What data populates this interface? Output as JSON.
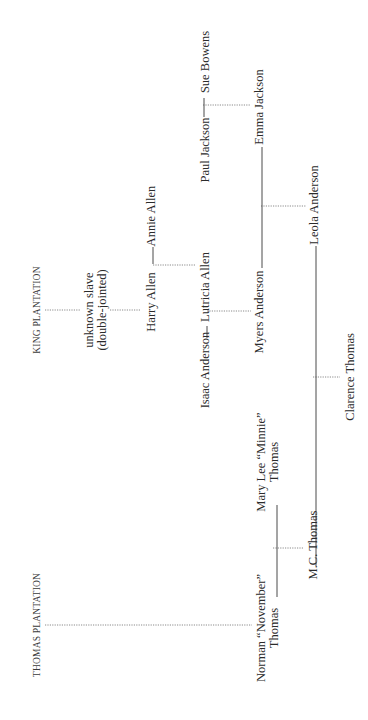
{
  "diagram": {
    "orientation": "rotated-90-ccw",
    "plantations": [
      {
        "id": "king",
        "label": "KING PLANTATION"
      },
      {
        "id": "thomas",
        "label": "THOMAS PLANTATION"
      }
    ],
    "people": {
      "unknown_slave": {
        "line1": "unknown slave",
        "line2": "(double-jointed)"
      },
      "harry_allen": {
        "name": "Harry Allen"
      },
      "annie_allen": {
        "name": "Annie Allen"
      },
      "lutricia_allen": {
        "name": "Lutricia Allen"
      },
      "isaac_anderson": {
        "name": "Isaac Anderson"
      },
      "myers_anderson": {
        "name": "Myers Anderson"
      },
      "paul_jackson": {
        "name": "Paul Jackson"
      },
      "sue_bowens": {
        "name": "Sue Bowens"
      },
      "emma_jackson": {
        "name": "Emma Jackson"
      },
      "leola_anderson": {
        "name": "Leola Anderson"
      },
      "clarence_thomas": {
        "name": "Clarence Thomas"
      },
      "mc_thomas": {
        "name": "M.C. Thomas"
      },
      "mary_lee_thomas": {
        "line1": "Mary Lee “Minnie”",
        "line2": "Thomas"
      },
      "norman_thomas": {
        "line1": "Norman “November”",
        "line2": "Thomas"
      }
    },
    "relationships": [
      {
        "type": "origin",
        "from": "KING PLANTATION",
        "to": "unknown slave (double-jointed)"
      },
      {
        "type": "parent-child",
        "from": "unknown slave (double-jointed)",
        "to": "Harry Allen"
      },
      {
        "type": "marriage",
        "a": "Harry Allen",
        "b": "Annie Allen"
      },
      {
        "type": "parent-child",
        "from": "Harry Allen & Annie Allen",
        "to": "Lutricia Allen"
      },
      {
        "type": "marriage",
        "a": "Isaac Anderson",
        "b": "Lutricia Allen"
      },
      {
        "type": "parent-child",
        "from": "Isaac Anderson & Lutricia Allen",
        "to": "Myers Anderson"
      },
      {
        "type": "marriage",
        "a": "Paul Jackson",
        "b": "Sue Bowens"
      },
      {
        "type": "parent-child",
        "from": "Paul Jackson & Sue Bowens",
        "to": "Emma Jackson"
      },
      {
        "type": "marriage",
        "a": "Myers Anderson",
        "b": "Emma Jackson"
      },
      {
        "type": "parent-child",
        "from": "Myers Anderson & Emma Jackson",
        "to": "Leola Anderson"
      },
      {
        "type": "origin",
        "from": "THOMAS PLANTATION",
        "to": "Norman “November” Thomas"
      },
      {
        "type": "marriage",
        "a": "Norman “November” Thomas",
        "b": "Mary Lee “Minnie” Thomas"
      },
      {
        "type": "parent-child",
        "from": "Norman & Mary Lee Thomas",
        "to": "M.C. Thomas"
      },
      {
        "type": "marriage",
        "a": "M.C. Thomas",
        "b": "Leola Anderson"
      },
      {
        "type": "parent-child",
        "from": "M.C. Thomas & Leola Anderson",
        "to": "Clarence Thomas"
      }
    ],
    "colors": {
      "background": "#ffffff",
      "text": "#2b2b2b",
      "solid_line": "#4a4a4a",
      "dotted_line": "#8a8a8a"
    }
  }
}
